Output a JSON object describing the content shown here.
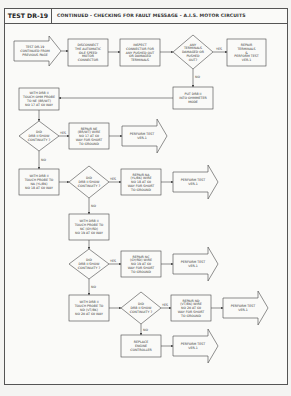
{
  "header": {
    "test_id": "TEST DR-19",
    "title": "CONTINUED - CHECKING FOR FAULT MESSAGE - A.I.S. MOTOR CIRCUITS"
  },
  "labels": {
    "yes": "YES",
    "no": "NO"
  },
  "nodes": {
    "start": [
      "TEST DR-19",
      "CONTINUED FROM",
      "PREVIOUS PAGE"
    ],
    "disconnect": [
      "DISCONNECT",
      "THE AUTOMATIC",
      "IDLE SPEED",
      "MOTOR",
      "CONNECTOR"
    ],
    "inspect": [
      "INSPECT",
      "CONNECTOR FOR",
      "ANY PUSHED OUT",
      "OR DAMAGED",
      "TERMINALS"
    ],
    "any_damaged": [
      "ANY",
      "TERMINALS",
      "DAMAGED OR",
      "PUSHED",
      "OUT?"
    ],
    "repair_terminals": [
      "REPAIR",
      "TERMINALS",
      "&",
      "PERFORM TEST",
      "VER-1"
    ],
    "ohmmeter": [
      "PUT DRB II",
      "INTO OHMMETER",
      "MODE"
    ],
    "probe1": [
      "WITH DRB II",
      "TOUCH OHM PROBE",
      "TO NE (BR/WT)",
      "NO 17 AT 60 WAY"
    ],
    "cont1": [
      "DID",
      "DRB II SHOW",
      "CONTINUITY ?"
    ],
    "repair1": [
      "REPAIR NE",
      "(BR/WT) WIRE",
      "NO 17 AT 60",
      "WAY FOR SHORT",
      "TO GROUND"
    ],
    "ver1_a": [
      "PERFORM TEST",
      "VER-1"
    ],
    "probe2": [
      "WITH DRB II",
      "TOUCH PROBE TO",
      "NA (YL/BK)",
      "NO 18 AT 60 WAY"
    ],
    "cont2": [
      "DID",
      "DRB II SHOW",
      "CONTINUITY ?"
    ],
    "repair2": [
      "REPAIR NA",
      "(YL/BK) WIRE",
      "NO 18 AT 60",
      "WAY FOR SHORT",
      "TO GROUND"
    ],
    "ver1_b": [
      "PERFORM TEST",
      "VER-1"
    ],
    "probe3": [
      "WITH DRB II",
      "TOUCH PROBE TO",
      "NC (GY/RD)",
      "NO 19 AT 60 WAY"
    ],
    "cont3": [
      "DID",
      "DRB II SHOW",
      "CONTINUITY ?"
    ],
    "repair3": [
      "REPAIR NC",
      "(GY/RD) WIRE",
      "NO 19 AT 60",
      "WAY FOR SHORT",
      "TO GROUND"
    ],
    "ver1_c": [
      "PERFORM TEST",
      "VER-1"
    ],
    "probe4": [
      "WITH DRB II",
      "TOUCH PROBE TO",
      "ND (VT/BK)",
      "NO 20 AT 60 WAY"
    ],
    "cont4": [
      "DID",
      "DRB II SHOW",
      "CONTINUITY ?"
    ],
    "repair4": [
      "REPAIR ND",
      "(VT/BK) WIRE",
      "NO 20 AT 60",
      "WAY FOR SHORT",
      "TO GROUND"
    ],
    "ver1_d": [
      "PERFORM TEST",
      "VER-1"
    ],
    "replace": [
      "REPLACE",
      "ENGINE",
      "CONTROLLER"
    ],
    "ver1_e": [
      "PERFORM TEST",
      "VER-1"
    ]
  }
}
